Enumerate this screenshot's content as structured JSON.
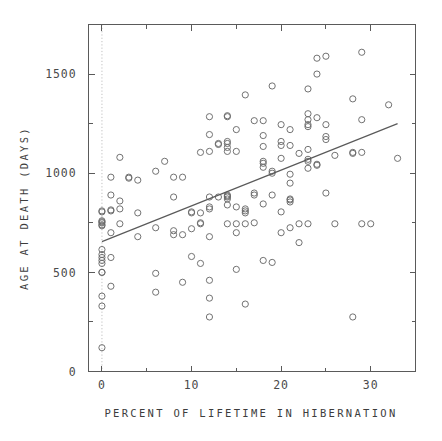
{
  "chart_data": {
    "type": "scatter",
    "title": "",
    "xlabel": "PERCENT OF LIFETIME IN HIBERNATION",
    "ylabel": "AGE AT DEATH (DAYS)",
    "xlim": [
      -1.5,
      35
    ],
    "ylim": [
      0,
      1750
    ],
    "grid": false,
    "legend": null,
    "xticks": [
      0,
      10,
      20,
      30
    ],
    "xticklabels": [
      "0",
      "10",
      "20",
      "30"
    ],
    "xminorticks": [
      5,
      15,
      25,
      35
    ],
    "yticks": [
      0,
      500,
      1000,
      1500
    ],
    "yticklabels": [
      "0",
      "500",
      "1000",
      "1500"
    ],
    "yminorticks": [
      250,
      750,
      1250,
      1750
    ],
    "reference_line": {
      "orientation": "vertical",
      "x": 0,
      "style": "dotted",
      "color": "#b9b9b9"
    },
    "trend_line": {
      "label": "least-squares fit",
      "x0": 0,
      "y0": 655,
      "x1": 33,
      "y1": 1250,
      "color": "#5a5a5a"
    },
    "marker": {
      "shape": "circle-open",
      "size": 3.1,
      "color": "#6a6a6a"
    },
    "points": [
      [
        0,
        120
      ],
      [
        0,
        330
      ],
      [
        0,
        380
      ],
      [
        0,
        500
      ],
      [
        0,
        500
      ],
      [
        0,
        545
      ],
      [
        0,
        560
      ],
      [
        0,
        575
      ],
      [
        0,
        590
      ],
      [
        0,
        615
      ],
      [
        0,
        735
      ],
      [
        0,
        740
      ],
      [
        0,
        750
      ],
      [
        0,
        755
      ],
      [
        0,
        760
      ],
      [
        0,
        805
      ],
      [
        0,
        810
      ],
      [
        1,
        430
      ],
      [
        1,
        575
      ],
      [
        1,
        700
      ],
      [
        1,
        810
      ],
      [
        1,
        815
      ],
      [
        1,
        890
      ],
      [
        1,
        980
      ],
      [
        2,
        745
      ],
      [
        2,
        820
      ],
      [
        2,
        860
      ],
      [
        2,
        1080
      ],
      [
        3,
        975
      ],
      [
        3,
        980
      ],
      [
        4,
        680
      ],
      [
        4,
        800
      ],
      [
        4,
        965
      ],
      [
        6,
        400
      ],
      [
        6,
        495
      ],
      [
        6,
        725
      ],
      [
        6,
        1010
      ],
      [
        7,
        1060
      ],
      [
        8,
        690
      ],
      [
        8,
        710
      ],
      [
        8,
        880
      ],
      [
        8,
        980
      ],
      [
        9,
        450
      ],
      [
        9,
        690
      ],
      [
        9,
        980
      ],
      [
        10,
        580
      ],
      [
        10,
        720
      ],
      [
        10,
        800
      ],
      [
        10,
        805
      ],
      [
        11,
        545
      ],
      [
        11,
        745
      ],
      [
        11,
        750
      ],
      [
        11,
        800
      ],
      [
        11,
        1105
      ],
      [
        12,
        275
      ],
      [
        12,
        370
      ],
      [
        12,
        460
      ],
      [
        12,
        680
      ],
      [
        12,
        820
      ],
      [
        12,
        830
      ],
      [
        12,
        880
      ],
      [
        12,
        1110
      ],
      [
        12,
        1195
      ],
      [
        12,
        1285
      ],
      [
        13,
        880
      ],
      [
        13,
        1145
      ],
      [
        13,
        1150
      ],
      [
        14,
        745
      ],
      [
        14,
        840
      ],
      [
        14,
        870
      ],
      [
        14,
        880
      ],
      [
        14,
        885
      ],
      [
        14,
        890
      ],
      [
        14,
        1110
      ],
      [
        14,
        1130
      ],
      [
        14,
        1150
      ],
      [
        14,
        1160
      ],
      [
        14,
        1285
      ],
      [
        14,
        1290
      ],
      [
        15,
        515
      ],
      [
        15,
        700
      ],
      [
        15,
        745
      ],
      [
        15,
        830
      ],
      [
        15,
        1110
      ],
      [
        15,
        1220
      ],
      [
        16,
        340
      ],
      [
        16,
        745
      ],
      [
        16,
        800
      ],
      [
        16,
        810
      ],
      [
        16,
        820
      ],
      [
        16,
        1395
      ],
      [
        17,
        750
      ],
      [
        17,
        890
      ],
      [
        17,
        900
      ],
      [
        17,
        1265
      ],
      [
        18,
        560
      ],
      [
        18,
        845
      ],
      [
        18,
        1030
      ],
      [
        18,
        1050
      ],
      [
        18,
        1060
      ],
      [
        18,
        1135
      ],
      [
        18,
        1190
      ],
      [
        18,
        1265
      ],
      [
        19,
        550
      ],
      [
        19,
        890
      ],
      [
        19,
        1000
      ],
      [
        19,
        1010
      ],
      [
        19,
        1440
      ],
      [
        20,
        700
      ],
      [
        20,
        805
      ],
      [
        20,
        1075
      ],
      [
        20,
        1140
      ],
      [
        20,
        1160
      ],
      [
        20,
        1245
      ],
      [
        21,
        725
      ],
      [
        21,
        855
      ],
      [
        21,
        865
      ],
      [
        21,
        870
      ],
      [
        21,
        950
      ],
      [
        21,
        995
      ],
      [
        21,
        1140
      ],
      [
        21,
        1220
      ],
      [
        22,
        650
      ],
      [
        22,
        745
      ],
      [
        22,
        1100
      ],
      [
        23,
        745
      ],
      [
        23,
        1025
      ],
      [
        23,
        1060
      ],
      [
        23,
        1070
      ],
      [
        23,
        1120
      ],
      [
        23,
        1235
      ],
      [
        23,
        1245
      ],
      [
        23,
        1270
      ],
      [
        23,
        1300
      ],
      [
        23,
        1425
      ],
      [
        24,
        1040
      ],
      [
        24,
        1045
      ],
      [
        24,
        1280
      ],
      [
        24,
        1500
      ],
      [
        24,
        1580
      ],
      [
        25,
        900
      ],
      [
        25,
        1170
      ],
      [
        25,
        1185
      ],
      [
        25,
        1245
      ],
      [
        25,
        1590
      ],
      [
        26,
        745
      ],
      [
        26,
        1090
      ],
      [
        28,
        275
      ],
      [
        28,
        1100
      ],
      [
        28,
        1105
      ],
      [
        28,
        1375
      ],
      [
        29,
        745
      ],
      [
        29,
        1105
      ],
      [
        29,
        1270
      ],
      [
        29,
        1610
      ],
      [
        30,
        745
      ],
      [
        32,
        1345
      ],
      [
        33,
        1075
      ]
    ]
  },
  "figure": {
    "background_color": "#ffffff",
    "frame_color": "#5a5a5a"
  }
}
